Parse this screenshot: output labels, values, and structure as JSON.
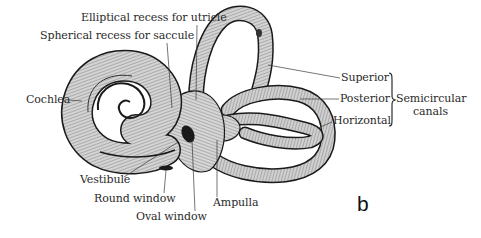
{
  "figure": {
    "panel_letter": "b",
    "labels": {
      "elliptical_recess": "Elliptical recess for utricle",
      "spherical_recess": "Spherical recess for saccule",
      "cochlea": "Cochlea",
      "superior": "Superior",
      "posterior": "Posterior",
      "horizontal": "Horizontal",
      "semicircular_line1": "Semicircular",
      "semicircular_line2": "canals",
      "vestibule": "Vestibule",
      "round_window": "Round window",
      "oval_window": "Oval window",
      "ampulla": "Ampulla"
    },
    "colors": {
      "ink": "#1a1a1a",
      "shade": "#9a9a9a",
      "fill": "#c9c9c9",
      "text": "#2a2a2a",
      "background": "#ffffff"
    }
  }
}
